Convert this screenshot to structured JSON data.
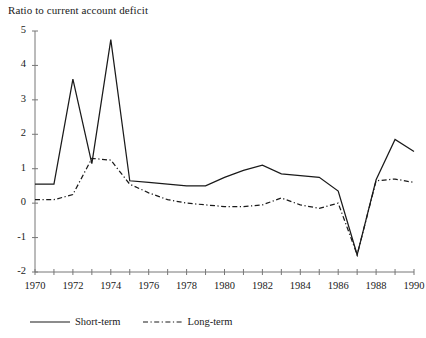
{
  "chart_data": {
    "type": "line",
    "title": "Ratio to current account deficit",
    "xlabel": "",
    "ylabel": "",
    "grid": false,
    "legend_position": "bottom-left",
    "xlim": [
      1970,
      1990
    ],
    "ylim": [
      -2,
      5
    ],
    "ytick_labels": [
      "5",
      "4",
      "3",
      "2",
      "1",
      "0",
      "-1",
      "-2"
    ],
    "ytick_values": [
      5,
      4,
      3,
      2,
      1,
      0,
      -1,
      -2
    ],
    "xtick_labels": [
      "1970",
      "1972",
      "1974",
      "1976",
      "1978",
      "1980",
      "1982",
      "1984",
      "1986",
      "1988",
      "1990"
    ],
    "xtick_values": [
      1970,
      1972,
      1974,
      1976,
      1978,
      1980,
      1982,
      1984,
      1986,
      1988,
      1990
    ],
    "x": [
      1970,
      1971,
      1972,
      1973,
      1974,
      1975,
      1976,
      1977,
      1978,
      1979,
      1980,
      1981,
      1982,
      1983,
      1984,
      1985,
      1986,
      1987,
      1988,
      1989,
      1990
    ],
    "series": [
      {
        "name": "Short-term",
        "style": "solid",
        "color": "#1a1a1a",
        "values": [
          0.55,
          0.55,
          3.6,
          1.15,
          4.75,
          0.65,
          0.6,
          0.55,
          0.5,
          0.5,
          0.75,
          0.95,
          1.1,
          0.85,
          0.8,
          0.75,
          0.35,
          -1.5,
          0.68,
          1.85,
          1.5
        ]
      },
      {
        "name": "Long-term",
        "style": "dash-dot",
        "color": "#1a1a1a",
        "values": [
          0.1,
          0.1,
          0.25,
          1.3,
          1.25,
          0.55,
          0.3,
          0.1,
          0.0,
          -0.05,
          -0.1,
          -0.1,
          -0.05,
          0.15,
          -0.05,
          -0.15,
          0.0,
          -1.5,
          0.65,
          0.7,
          0.6
        ]
      }
    ]
  },
  "legend": {
    "items": [
      {
        "label": "Short-term",
        "style": "solid"
      },
      {
        "label": "Long-term",
        "style": "dash-dot"
      }
    ]
  },
  "axes": {
    "y_axis_name": "value-axis",
    "x_axis_name": "year-axis"
  }
}
